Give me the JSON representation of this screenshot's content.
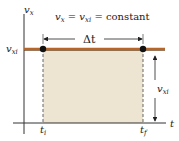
{
  "diagram": {
    "equation": {
      "v": "v",
      "x_sub": "x",
      "eq1": " = ",
      "v2": "v",
      "xi_sub": "xi",
      "eq2": " = constant"
    },
    "y_axis_label": {
      "main": "v",
      "sub": "x"
    },
    "x_axis_label": "t",
    "level_label": {
      "main": "v",
      "sub": "xi"
    },
    "interval_label": "Δt",
    "height_label": {
      "main": "v",
      "sub": "xi"
    },
    "start_label": {
      "main": "t",
      "sub": "i"
    },
    "end_label": {
      "main": "t",
      "sub": "f"
    },
    "colors": {
      "velocity_line": "#b8652a",
      "area_fill": "#ede4d2",
      "axis": "#333333",
      "point": "#111111"
    }
  }
}
